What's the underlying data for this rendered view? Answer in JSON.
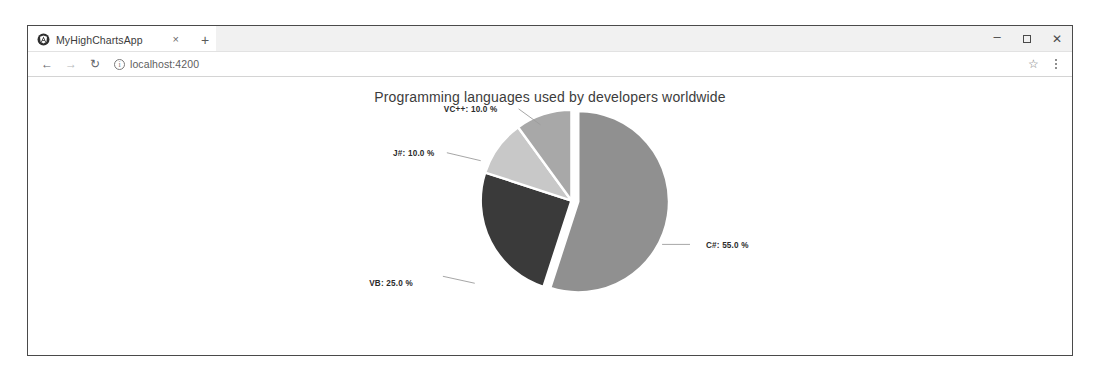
{
  "browser": {
    "tab": {
      "favicon_icon": "angular-logo-icon",
      "title": "MyHighChartsApp",
      "close_label": "×"
    },
    "new_tab_label": "+",
    "window_controls": {
      "minimize_label": "–",
      "maximize_icon": "maximize-icon",
      "close_label": "✕"
    },
    "toolbar": {
      "back_label": "←",
      "forward_label": "→",
      "reload_label": "↻",
      "site_info_label": "i",
      "url": "localhost:4200",
      "url_placeholder": "Search Google or type a URL",
      "bookmark_label": "☆",
      "menu_icon": "kebab-menu-icon"
    }
  },
  "chart_data": {
    "type": "pie",
    "title": "Programming languages used by developers worldwide",
    "xlabel": "",
    "ylabel": "",
    "legend": "none",
    "grid": false,
    "value_suffix": " %",
    "categories": [
      "C#",
      "VB",
      "J#",
      "VC++"
    ],
    "values": [
      55.0,
      25.0,
      10.0,
      10.0
    ],
    "slices": [
      {
        "name": "C#",
        "value": 55.0,
        "label": "C#: 55.0 %",
        "color": "#909090",
        "exploded": true,
        "label_x": 678,
        "label_y": 172,
        "label_anchor": "start",
        "leader": "M 634 168 L 662 168"
      },
      {
        "name": "VB",
        "value": 25.0,
        "label": "VB: 25.0 %",
        "color": "#3a3a3a",
        "exploded": false,
        "label_x": 340,
        "label_y": 210,
        "label_anchor": "start",
        "leader": "M 414 200 L 446 207"
      },
      {
        "name": "J#",
        "value": 10.0,
        "label": "J#: 10.0 %",
        "color": "#c8c8c8",
        "exploded": false,
        "label_x": 364,
        "label_y": 79,
        "label_anchor": "start",
        "leader": "M 418 76 L 452 84"
      },
      {
        "name": "VC++",
        "value": 10.0,
        "label": "VC++: 10.0 %",
        "color": "#a8a8a8",
        "exploded": false,
        "label_x": 415,
        "label_y": 35,
        "label_anchor": "start",
        "leader": "M 490 32 L 512 48"
      }
    ],
    "colors": {
      "c_sharp": "#909090",
      "vb": "#3a3a3a",
      "j_sharp": "#c8c8c8",
      "vc_plus_plus": "#a8a8a8",
      "background": "#ffffff",
      "title": "#3c3c3c",
      "label": "#2b2b2b"
    }
  }
}
